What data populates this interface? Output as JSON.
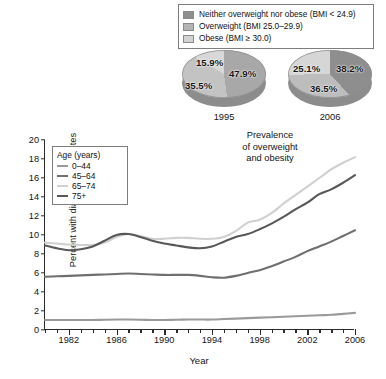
{
  "bmi_legend": {
    "items": [
      {
        "label": "Neither overweight nor obese (BMI < 24.9)",
        "color": "#8e8e8e"
      },
      {
        "label": "Overweight (BMI 25.0–29.9)",
        "color": "#b4b4b4"
      },
      {
        "label": "Obese (BMI ≥ 30.0)",
        "color": "#d2d2d2"
      }
    ]
  },
  "pies_title": "Prevalence of overweight and obesity",
  "pies_title_lines": [
    "Prevalence",
    "of overweight",
    "and obesity"
  ],
  "pies": [
    {
      "year": "1995",
      "slices": [
        {
          "label": "47.9%",
          "value": 47.9,
          "category": "Neither overweight nor obese (BMI < 24.9)",
          "color": "#a8a8a8"
        },
        {
          "label": "35.5%",
          "value": 35.5,
          "category": "Overweight (BMI 25.0–29.9)",
          "color": "#c3c3c3"
        },
        {
          "label": "15.9%",
          "value": 15.9,
          "category": "Obese (BMI ≥ 30.0)",
          "color": "#d8d8d8"
        }
      ]
    },
    {
      "year": "2006",
      "slices": [
        {
          "label": "38.2%",
          "value": 38.2,
          "category": "Neither overweight nor obese (BMI < 24.9)",
          "color": "#8e8e8e"
        },
        {
          "label": "36.5%",
          "value": 36.5,
          "category": "Overweight (BMI 25.0–29.9)",
          "color": "#bdbdbd"
        },
        {
          "label": "25.1%",
          "value": 25.1,
          "category": "Obese (BMI ≥ 30.0)",
          "color": "#d6d6d6"
        }
      ]
    }
  ],
  "chart_data": {
    "type": "line",
    "title": "",
    "xlabel": "Year",
    "ylabel": "Percent with diagnosed diabetes",
    "xlim": [
      1980,
      2006
    ],
    "ylim": [
      0,
      20
    ],
    "yticks": [
      0,
      2,
      4,
      6,
      8,
      10,
      12,
      14,
      16,
      18,
      20
    ],
    "xticks": [
      1982,
      1986,
      1990,
      1994,
      1998,
      2002,
      2006
    ],
    "xminor_step": 1,
    "grid": false,
    "legend_title": "Age (years)",
    "legend_position": "top-left",
    "x": [
      1980,
      1981,
      1982,
      1983,
      1984,
      1985,
      1986,
      1987,
      1988,
      1989,
      1990,
      1991,
      1992,
      1993,
      1994,
      1995,
      1996,
      1997,
      1998,
      1999,
      2000,
      2001,
      2002,
      2003,
      2004,
      2005,
      2006
    ],
    "series": [
      {
        "name": "0–44",
        "color": "#9a9a9a",
        "values": [
          1.05,
          1.05,
          1.05,
          1.05,
          1.05,
          1.08,
          1.1,
          1.1,
          1.08,
          1.05,
          1.05,
          1.08,
          1.1,
          1.1,
          1.1,
          1.15,
          1.2,
          1.25,
          1.3,
          1.35,
          1.4,
          1.45,
          1.5,
          1.55,
          1.6,
          1.7,
          1.8
        ]
      },
      {
        "name": "45–64",
        "color": "#6f6f6f",
        "values": [
          5.6,
          5.65,
          5.7,
          5.75,
          5.8,
          5.85,
          5.9,
          5.95,
          5.9,
          5.85,
          5.8,
          5.8,
          5.8,
          5.7,
          5.55,
          5.5,
          5.7,
          6.0,
          6.3,
          6.7,
          7.2,
          7.7,
          8.3,
          8.8,
          9.3,
          9.9,
          10.5
        ]
      },
      {
        "name": "65–74",
        "color": "#d0d0d0",
        "values": [
          9.2,
          9.1,
          9.0,
          8.95,
          8.95,
          9.2,
          9.8,
          10.1,
          9.9,
          9.6,
          9.6,
          9.7,
          9.7,
          9.6,
          9.6,
          9.8,
          10.4,
          11.3,
          11.6,
          12.3,
          13.3,
          14.2,
          15.1,
          16.0,
          16.9,
          17.6,
          18.2
        ]
      },
      {
        "name": "75+",
        "color": "#585858",
        "values": [
          8.9,
          8.6,
          8.4,
          8.5,
          8.8,
          9.4,
          10.0,
          10.1,
          9.8,
          9.4,
          9.1,
          8.9,
          8.7,
          8.6,
          8.8,
          9.3,
          9.8,
          10.1,
          10.6,
          11.2,
          11.9,
          12.7,
          13.4,
          14.3,
          14.8,
          15.5,
          16.3
        ]
      }
    ]
  }
}
